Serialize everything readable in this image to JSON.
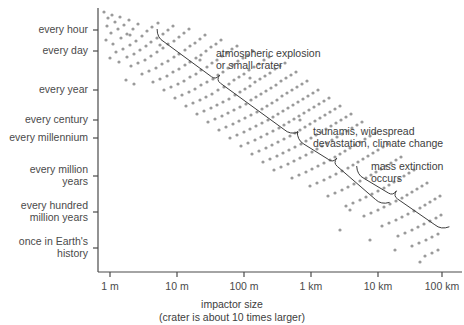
{
  "chart_data": {
    "type": "scatter",
    "title": "",
    "xlabel": "impactor size",
    "xsublabel": "(crater is about 10 times larger)",
    "ylabel": "",
    "grid": false,
    "legend": "none",
    "xscale": "log",
    "yscale": "log",
    "x_tick_labels": [
      "1 m",
      "10 m",
      "100 m",
      "1 km",
      "10 km",
      "100 km"
    ],
    "x_tick_values": [
      1,
      10,
      100,
      1000,
      10000,
      100000
    ],
    "x_tick_px": [
      110,
      177,
      244,
      311,
      378,
      442
    ],
    "xlim_px": [
      98,
      462
    ],
    "y_tick_labels": [
      "every hour",
      "every day",
      "every year",
      "every century",
      "every millennium",
      "every million\nyears",
      "every hundred\nmillion years",
      "once in Earth's\nhistory"
    ],
    "y_tick_px": [
      30,
      51,
      90,
      120,
      138,
      176,
      212,
      248
    ],
    "ylim_px": [
      8,
      272
    ],
    "point_color": "#9a9a9a",
    "point_radius_px": 1.6,
    "point_count": 300,
    "band_description": "Descending diagonal band of points from upper-left (small frequent impactors) to lower-right (large rare impactors); roughly one decade of frequency lost per decade of size gained.",
    "band_start_px": [
      104,
      14
    ],
    "band_end_px": [
      442,
      262
    ],
    "band_spread_px": 26,
    "points": [
      [
        104,
        12
      ],
      [
        108,
        18
      ],
      [
        112,
        15
      ],
      [
        107,
        26
      ],
      [
        115,
        22
      ],
      [
        120,
        17
      ],
      [
        111,
        33
      ],
      [
        118,
        29
      ],
      [
        124,
        25
      ],
      [
        129,
        20
      ],
      [
        106,
        40
      ],
      [
        113,
        44
      ],
      [
        121,
        38
      ],
      [
        127,
        34
      ],
      [
        133,
        29
      ],
      [
        138,
        24
      ],
      [
        116,
        52
      ],
      [
        123,
        49
      ],
      [
        130,
        45
      ],
      [
        136,
        41
      ],
      [
        142,
        36
      ],
      [
        147,
        31
      ],
      [
        152,
        27
      ],
      [
        158,
        23
      ],
      [
        110,
        58
      ],
      [
        119,
        62
      ],
      [
        127,
        57
      ],
      [
        134,
        54
      ],
      [
        140,
        50
      ],
      [
        146,
        46
      ],
      [
        151,
        42
      ],
      [
        157,
        38
      ],
      [
        163,
        34
      ],
      [
        168,
        30
      ],
      [
        173,
        26
      ],
      [
        131,
        66
      ],
      [
        138,
        63
      ],
      [
        145,
        60
      ],
      [
        151,
        56
      ],
      [
        157,
        52
      ],
      [
        163,
        48
      ],
      [
        168,
        44
      ],
      [
        174,
        41
      ],
      [
        179,
        37
      ],
      [
        184,
        33
      ],
      [
        189,
        29
      ],
      [
        142,
        74
      ],
      [
        149,
        71
      ],
      [
        156,
        68
      ],
      [
        162,
        64
      ],
      [
        168,
        61
      ],
      [
        174,
        57
      ],
      [
        179,
        54
      ],
      [
        185,
        50
      ],
      [
        190,
        46
      ],
      [
        195,
        43
      ],
      [
        200,
        39
      ],
      [
        205,
        35
      ],
      [
        126,
        80
      ],
      [
        134,
        84
      ],
      [
        153,
        82
      ],
      [
        160,
        79
      ],
      [
        167,
        76
      ],
      [
        173,
        72
      ],
      [
        179,
        69
      ],
      [
        185,
        65
      ],
      [
        190,
        62
      ],
      [
        196,
        58
      ],
      [
        201,
        55
      ],
      [
        206,
        51
      ],
      [
        211,
        47
      ],
      [
        216,
        44
      ],
      [
        221,
        40
      ],
      [
        164,
        90
      ],
      [
        171,
        87
      ],
      [
        178,
        84
      ],
      [
        184,
        81
      ],
      [
        190,
        77
      ],
      [
        196,
        74
      ],
      [
        201,
        70
      ],
      [
        207,
        67
      ],
      [
        212,
        63
      ],
      [
        217,
        60
      ],
      [
        222,
        56
      ],
      [
        227,
        53
      ],
      [
        232,
        49
      ],
      [
        237,
        46
      ],
      [
        175,
        98
      ],
      [
        182,
        95
      ],
      [
        189,
        92
      ],
      [
        195,
        89
      ],
      [
        201,
        85
      ],
      [
        207,
        82
      ],
      [
        213,
        79
      ],
      [
        218,
        75
      ],
      [
        223,
        72
      ],
      [
        228,
        68
      ],
      [
        233,
        65
      ],
      [
        238,
        61
      ],
      [
        243,
        58
      ],
      [
        248,
        55
      ],
      [
        253,
        51
      ],
      [
        186,
        106
      ],
      [
        193,
        103
      ],
      [
        200,
        100
      ],
      [
        206,
        97
      ],
      [
        212,
        94
      ],
      [
        218,
        90
      ],
      [
        224,
        87
      ],
      [
        229,
        84
      ],
      [
        234,
        80
      ],
      [
        239,
        77
      ],
      [
        244,
        74
      ],
      [
        249,
        70
      ],
      [
        254,
        67
      ],
      [
        259,
        64
      ],
      [
        264,
        60
      ],
      [
        269,
        57
      ],
      [
        197,
        114
      ],
      [
        204,
        111
      ],
      [
        211,
        108
      ],
      [
        217,
        105
      ],
      [
        223,
        102
      ],
      [
        229,
        99
      ],
      [
        235,
        95
      ],
      [
        240,
        92
      ],
      [
        245,
        89
      ],
      [
        250,
        86
      ],
      [
        255,
        82
      ],
      [
        260,
        79
      ],
      [
        265,
        76
      ],
      [
        270,
        73
      ],
      [
        275,
        69
      ],
      [
        280,
        66
      ],
      [
        285,
        63
      ],
      [
        208,
        122
      ],
      [
        215,
        119
      ],
      [
        222,
        116
      ],
      [
        228,
        113
      ],
      [
        234,
        110
      ],
      [
        240,
        107
      ],
      [
        246,
        104
      ],
      [
        251,
        100
      ],
      [
        256,
        97
      ],
      [
        261,
        94
      ],
      [
        266,
        91
      ],
      [
        271,
        88
      ],
      [
        276,
        85
      ],
      [
        281,
        81
      ],
      [
        286,
        78
      ],
      [
        291,
        75
      ],
      [
        296,
        72
      ],
      [
        219,
        130
      ],
      [
        226,
        127
      ],
      [
        233,
        124
      ],
      [
        239,
        121
      ],
      [
        245,
        118
      ],
      [
        251,
        115
      ],
      [
        257,
        112
      ],
      [
        262,
        109
      ],
      [
        267,
        106
      ],
      [
        272,
        103
      ],
      [
        277,
        100
      ],
      [
        282,
        96
      ],
      [
        287,
        93
      ],
      [
        292,
        90
      ],
      [
        297,
        87
      ],
      [
        302,
        84
      ],
      [
        307,
        81
      ],
      [
        230,
        138
      ],
      [
        237,
        135
      ],
      [
        244,
        132
      ],
      [
        250,
        129
      ],
      [
        256,
        126
      ],
      [
        262,
        123
      ],
      [
        268,
        120
      ],
      [
        273,
        117
      ],
      [
        278,
        114
      ],
      [
        283,
        111
      ],
      [
        288,
        108
      ],
      [
        293,
        105
      ],
      [
        298,
        102
      ],
      [
        303,
        99
      ],
      [
        308,
        96
      ],
      [
        313,
        93
      ],
      [
        318,
        90
      ],
      [
        241,
        146
      ],
      [
        248,
        143
      ],
      [
        255,
        140
      ],
      [
        261,
        137
      ],
      [
        267,
        134
      ],
      [
        273,
        131
      ],
      [
        279,
        128
      ],
      [
        284,
        125
      ],
      [
        289,
        122
      ],
      [
        294,
        119
      ],
      [
        299,
        116
      ],
      [
        304,
        113
      ],
      [
        309,
        110
      ],
      [
        314,
        107
      ],
      [
        319,
        104
      ],
      [
        324,
        101
      ],
      [
        329,
        98
      ],
      [
        252,
        154
      ],
      [
        259,
        151
      ],
      [
        266,
        148
      ],
      [
        272,
        145
      ],
      [
        278,
        142
      ],
      [
        284,
        139
      ],
      [
        290,
        136
      ],
      [
        295,
        133
      ],
      [
        300,
        130
      ],
      [
        305,
        127
      ],
      [
        310,
        124
      ],
      [
        315,
        121
      ],
      [
        320,
        118
      ],
      [
        325,
        115
      ],
      [
        330,
        112
      ],
      [
        335,
        109
      ],
      [
        340,
        106
      ],
      [
        263,
        162
      ],
      [
        270,
        159
      ],
      [
        277,
        156
      ],
      [
        283,
        153
      ],
      [
        289,
        150
      ],
      [
        295,
        147
      ],
      [
        301,
        144
      ],
      [
        306,
        141
      ],
      [
        311,
        138
      ],
      [
        316,
        135
      ],
      [
        321,
        132
      ],
      [
        326,
        129
      ],
      [
        331,
        126
      ],
      [
        336,
        123
      ],
      [
        341,
        120
      ],
      [
        346,
        117
      ],
      [
        351,
        114
      ],
      [
        274,
        170
      ],
      [
        281,
        167
      ],
      [
        288,
        164
      ],
      [
        294,
        161
      ],
      [
        300,
        158
      ],
      [
        306,
        155
      ],
      [
        312,
        152
      ],
      [
        317,
        149
      ],
      [
        322,
        146
      ],
      [
        327,
        143
      ],
      [
        332,
        140
      ],
      [
        337,
        137
      ],
      [
        342,
        134
      ],
      [
        347,
        131
      ],
      [
        352,
        128
      ],
      [
        357,
        125
      ],
      [
        362,
        122
      ],
      [
        292,
        178
      ],
      [
        299,
        175
      ],
      [
        306,
        172
      ],
      [
        312,
        169
      ],
      [
        318,
        166
      ],
      [
        324,
        163
      ],
      [
        330,
        160
      ],
      [
        335,
        157
      ],
      [
        340,
        154
      ],
      [
        345,
        151
      ],
      [
        350,
        148
      ],
      [
        355,
        145
      ],
      [
        360,
        142
      ],
      [
        365,
        139
      ],
      [
        370,
        136
      ],
      [
        375,
        133
      ],
      [
        310,
        186
      ],
      [
        317,
        183
      ],
      [
        324,
        180
      ],
      [
        330,
        177
      ],
      [
        336,
        174
      ],
      [
        342,
        171
      ],
      [
        348,
        168
      ],
      [
        353,
        165
      ],
      [
        358,
        162
      ],
      [
        363,
        159
      ],
      [
        368,
        156
      ],
      [
        373,
        153
      ],
      [
        378,
        150
      ],
      [
        383,
        147
      ],
      [
        388,
        144
      ],
      [
        328,
        196
      ],
      [
        335,
        193
      ],
      [
        342,
        190
      ],
      [
        348,
        187
      ],
      [
        354,
        184
      ],
      [
        360,
        181
      ],
      [
        366,
        178
      ],
      [
        371,
        175
      ],
      [
        376,
        172
      ],
      [
        381,
        169
      ],
      [
        386,
        166
      ],
      [
        391,
        163
      ],
      [
        396,
        160
      ],
      [
        401,
        157
      ],
      [
        346,
        206
      ],
      [
        353,
        203
      ],
      [
        360,
        200
      ],
      [
        366,
        197
      ],
      [
        372,
        194
      ],
      [
        378,
        191
      ],
      [
        384,
        188
      ],
      [
        389,
        185
      ],
      [
        394,
        182
      ],
      [
        399,
        179
      ],
      [
        404,
        176
      ],
      [
        409,
        173
      ],
      [
        414,
        170
      ],
      [
        364,
        216
      ],
      [
        371,
        213
      ],
      [
        378,
        210
      ],
      [
        384,
        207
      ],
      [
        390,
        204
      ],
      [
        396,
        201
      ],
      [
        402,
        198
      ],
      [
        407,
        195
      ],
      [
        412,
        192
      ],
      [
        417,
        189
      ],
      [
        422,
        186
      ],
      [
        427,
        183
      ],
      [
        382,
        226
      ],
      [
        389,
        223
      ],
      [
        396,
        220
      ],
      [
        402,
        217
      ],
      [
        408,
        214
      ],
      [
        414,
        211
      ],
      [
        420,
        208
      ],
      [
        425,
        205
      ],
      [
        430,
        202
      ],
      [
        435,
        199
      ],
      [
        440,
        196
      ],
      [
        398,
        236
      ],
      [
        405,
        233
      ],
      [
        412,
        230
      ],
      [
        418,
        227
      ],
      [
        424,
        224
      ],
      [
        430,
        221
      ],
      [
        436,
        218
      ],
      [
        441,
        215
      ],
      [
        412,
        246
      ],
      [
        419,
        243
      ],
      [
        426,
        240
      ],
      [
        432,
        237
      ],
      [
        438,
        234
      ],
      [
        425,
        256
      ],
      [
        432,
        253
      ],
      [
        438,
        250
      ],
      [
        350,
        210
      ],
      [
        300,
        120
      ],
      [
        250,
        78
      ],
      [
        200,
        60
      ],
      [
        160,
        45
      ],
      [
        130,
        35
      ],
      [
        395,
        250
      ],
      [
        370,
        240
      ],
      [
        340,
        230
      ],
      [
        420,
        262
      ]
    ],
    "annotations": [
      {
        "id": "atmospheric",
        "text": "atmospheric explosion\nor small crater",
        "text_px": [
          216,
          47
        ],
        "brace_start_px": [
          157,
          38
        ],
        "brace_end_px": [
          290,
          135
        ],
        "brace_notch_px": [
          216,
          80
        ]
      },
      {
        "id": "tsunami",
        "text": "tsunamis, widespread\ndevastation, climate change",
        "text_px": [
          313,
          125
        ],
        "brace_start_px": [
          297,
          140
        ],
        "brace_end_px": [
          381,
          205
        ],
        "brace_notch_px": [
          333,
          163
        ]
      },
      {
        "id": "extinction",
        "text": "mass extinction\noccurs",
        "text_px": [
          371,
          160
        ],
        "brace_start_px": [
          357,
          175
        ],
        "brace_end_px": [
          441,
          230
        ],
        "brace_notch_px": [
          393,
          196
        ]
      }
    ]
  },
  "colors": {
    "axis": "#4a4a4a",
    "point": "#9a9a9a",
    "text": "#3d3d3d",
    "background": "#ffffff"
  }
}
